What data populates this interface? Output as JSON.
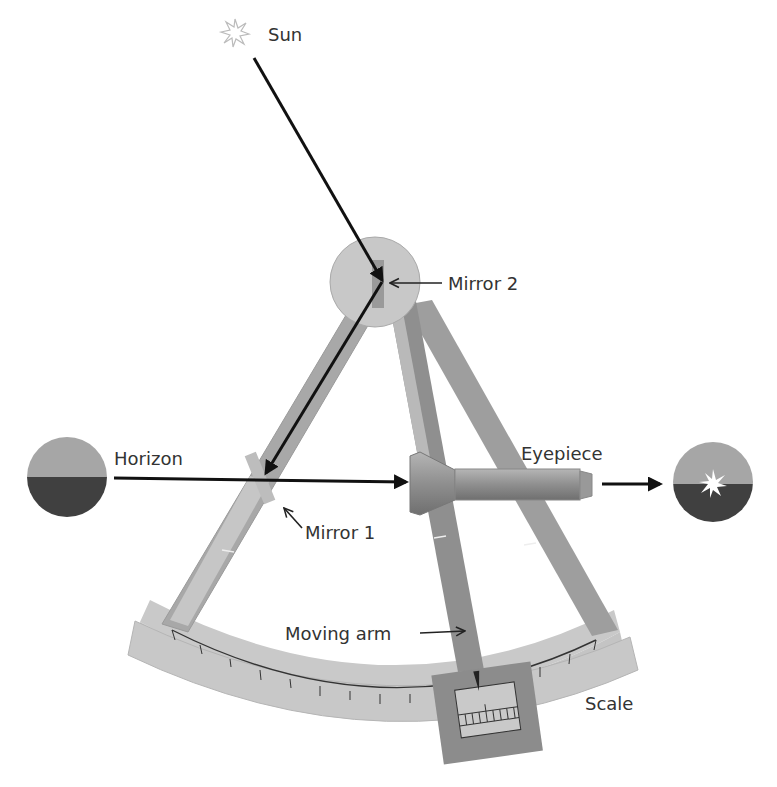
{
  "diagram": {
    "type": "sextant",
    "labels": {
      "sun": "Sun",
      "mirror2": "Mirror 2",
      "horizon": "Horizon",
      "eyepiece": "Eyepiece",
      "mirror1": "Mirror 1",
      "moving_arm": "Moving arm",
      "scale": "Scale"
    },
    "colors": {
      "frame_light": "#c8c8c8",
      "frame_mid": "#a8a8a8",
      "frame_dark": "#8a8a8a",
      "mirror": "#9a9a9a",
      "sky": "#a6a6a6",
      "sea": "#404040",
      "ray": "#111111",
      "text": "#333333"
    },
    "icons": {
      "sun": "sun-starburst-icon",
      "horizon_view": "horizon-disc-icon",
      "eyepiece_view": "horizon-with-sun-disc-icon"
    }
  }
}
